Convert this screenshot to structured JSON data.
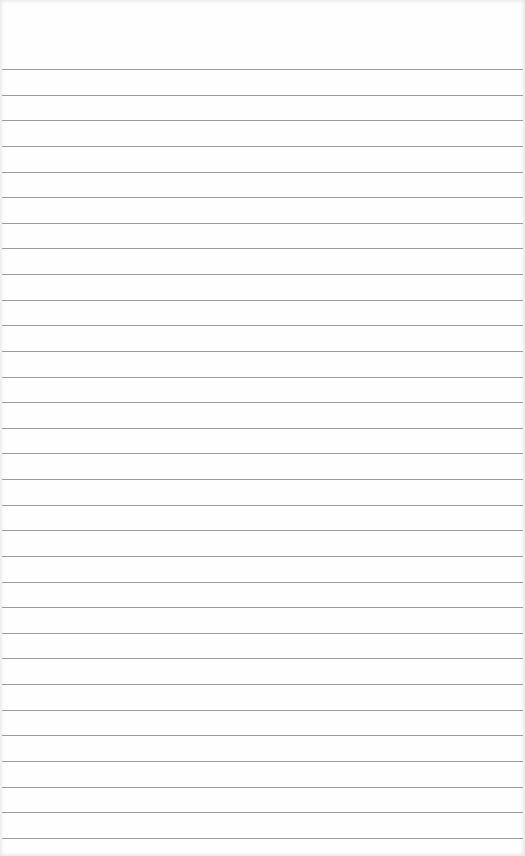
{
  "paper": {
    "type": "lined notepad sheet",
    "background_color": "#fefefe",
    "rule_color": "#9b9b9b",
    "first_rule_y": 69,
    "rule_spacing": 25.63,
    "rule_count": 31
  }
}
